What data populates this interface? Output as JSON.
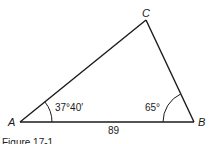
{
  "figure": {
    "caption": "Figure 17-1",
    "vertices": {
      "A": {
        "label": "A"
      },
      "B": {
        "label": "B"
      },
      "C": {
        "label": "C"
      }
    },
    "angles": {
      "A": "37°40′",
      "B": "65°"
    },
    "sides": {
      "AB": "89"
    },
    "colors": {
      "stroke": "#1a1a1a",
      "background": "#ffffff"
    }
  }
}
